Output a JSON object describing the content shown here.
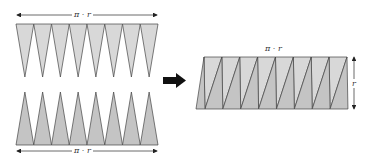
{
  "diagram": {
    "labels": {
      "top_width": "π · r",
      "bottom_width": "π · r",
      "result_width": "π · r",
      "result_height": "r"
    },
    "sectors_per_row": 8,
    "colors": {
      "upper_sector_fill": "#d8d8d8",
      "lower_sector_fill": "#c4c4c4",
      "outline": "#444444",
      "arrow": "#111111"
    }
  }
}
